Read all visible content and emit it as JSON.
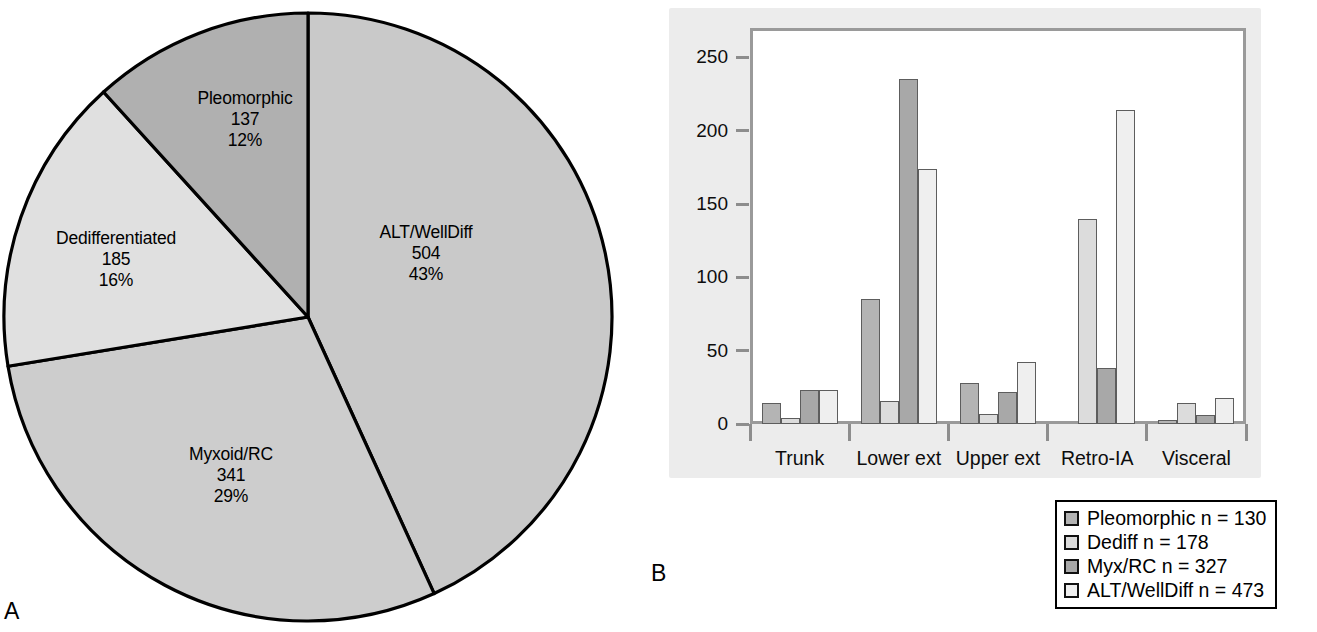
{
  "figure": {
    "panel_a_letter": "A",
    "panel_b_letter": "B"
  },
  "colors": {
    "pleomorphic": "#b4b4b4",
    "dediff": "#dcdcdc",
    "myx_rc": "#a8a8a8",
    "alt_welldiff": "#efefef",
    "pie_alt": "#c9c9c9",
    "pie_myx": "#cdcdcd",
    "pie_dediff": "#e0e0e0",
    "pie_pleo": "#b0b0b0",
    "plate": "#ececec",
    "frame": "#9a9a9a",
    "outline": "#000000"
  },
  "pie_labels": {
    "alt": {
      "name": "ALT/WellDiff",
      "count": "504",
      "pct": "43%"
    },
    "myx": {
      "name": "Myxoid/RC",
      "count": "341",
      "pct": "29%"
    },
    "dediff": {
      "name": "Dedifferentiated",
      "count": "185",
      "pct": "16%"
    },
    "pleo": {
      "name": "Pleomorphic",
      "count": "137",
      "pct": "12%"
    }
  },
  "legend": {
    "items": [
      {
        "label": "Pleomorphic n = 130",
        "swatch": "#b4b4b4"
      },
      {
        "label": "Dediff n = 178",
        "swatch": "#dcdcdc"
      },
      {
        "label": "Myx/RC n = 327",
        "swatch": "#a8a8a8"
      },
      {
        "label": "ALT/WellDiff n = 473",
        "swatch": "#efefef"
      }
    ]
  },
  "chart_data": [
    {
      "type": "pie",
      "title": "",
      "panel": "A",
      "labels": [
        "ALT/WellDiff",
        "Myxoid/RC",
        "Dedifferentiated",
        "Pleomorphic"
      ],
      "values": [
        504,
        341,
        185,
        137
      ],
      "percent": [
        43,
        29,
        16,
        12
      ],
      "total": 1167,
      "colors": [
        "#c9c9c9",
        "#cdcdcd",
        "#e0e0e0",
        "#b0b0b0"
      ],
      "start_angle_deg": 0,
      "direction": "clockwise",
      "legend": "none",
      "annotations": [
        "ALT/WellDiff 504 43%",
        "Myxoid/RC 341 29%",
        "Dedifferentiated 185 16%",
        "Pleomorphic 137 12%"
      ]
    },
    {
      "type": "bar",
      "panel": "B",
      "title": "",
      "xlabel": "",
      "ylabel": "",
      "categories": [
        "Trunk",
        "Lower ext",
        "Upper ext",
        "Retro-IA",
        "Visceral"
      ],
      "series": [
        {
          "name": "Pleomorphic n = 130",
          "color": "#b4b4b4",
          "values": [
            14,
            85,
            28,
            0,
            3
          ]
        },
        {
          "name": "Dediff n = 178",
          "color": "#dcdcdc",
          "values": [
            4,
            16,
            7,
            140,
            14
          ]
        },
        {
          "name": "Myx/RC n = 327",
          "color": "#a8a8a8",
          "values": [
            23,
            235,
            22,
            38,
            6
          ]
        },
        {
          "name": "ALT/WellDiff n = 473",
          "color": "#efefef",
          "values": [
            23,
            174,
            42,
            214,
            18
          ]
        }
      ],
      "ylim": [
        0,
        270
      ],
      "yticks": [
        0,
        50,
        100,
        150,
        200,
        250
      ],
      "ytick_labels": [
        "0",
        "50",
        "100",
        "150",
        "200",
        "250"
      ],
      "grid": false,
      "legend_position": "below-right"
    }
  ]
}
